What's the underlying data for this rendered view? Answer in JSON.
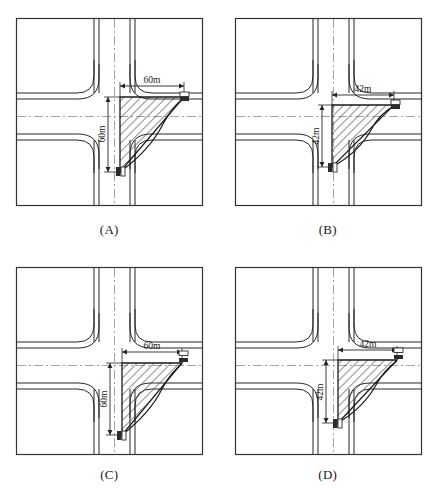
{
  "figure": {
    "type": "engineering-diagram-set",
    "background_color": "#ffffff",
    "line_color": "#262626",
    "hatch_color": "#333333",
    "centerline_color": "#999999",
    "panel_width": 218,
    "panel_height": 245,
    "columns": 2,
    "rows": 2
  },
  "panels": [
    {
      "id": "A",
      "caption": "(A)",
      "horizontal_dimension": "60m",
      "vertical_dimension": "60m",
      "triangle": {
        "apex_x": 120,
        "apex_y": 97,
        "right_x": 184,
        "right_y": 97,
        "bottom_x": 120,
        "bottom_y": 172
      },
      "triangle_offset_x": 0,
      "vehicle_markers": 2,
      "frame": {
        "x": 16,
        "y": 18,
        "w": 187,
        "h": 188
      }
    },
    {
      "id": "B",
      "caption": "(B)",
      "horizontal_dimension": "42m",
      "vertical_dimension": "42m",
      "triangle": {
        "apex_x": 113,
        "apex_y": 105,
        "right_x": 175,
        "right_y": 105,
        "bottom_x": 113,
        "bottom_y": 167
      },
      "triangle_offset_x": 0,
      "vehicle_markers": 2,
      "frame": {
        "x": 16,
        "y": 18,
        "w": 187,
        "h": 188
      }
    },
    {
      "id": "C",
      "caption": "(C)",
      "horizontal_dimension": "60m",
      "vertical_dimension": "60m",
      "triangle": {
        "apex_x": 122,
        "apex_y": 118,
        "right_x": 182,
        "right_y": 118,
        "bottom_x": 122,
        "bottom_y": 190
      },
      "triangle_offset_x": 8,
      "vehicle_markers": 2,
      "frame": {
        "x": 16,
        "y": 22,
        "w": 187,
        "h": 188
      }
    },
    {
      "id": "D",
      "caption": "(D)",
      "horizontal_dimension": "42m",
      "vertical_dimension": "42m",
      "triangle": {
        "apex_x": 119,
        "apex_y": 115,
        "right_x": 178,
        "right_y": 115,
        "bottom_x": 119,
        "bottom_y": 178
      },
      "triangle_offset_x": 6,
      "vehicle_markers": 2,
      "frame": {
        "x": 16,
        "y": 22,
        "w": 187,
        "h": 188
      }
    }
  ]
}
